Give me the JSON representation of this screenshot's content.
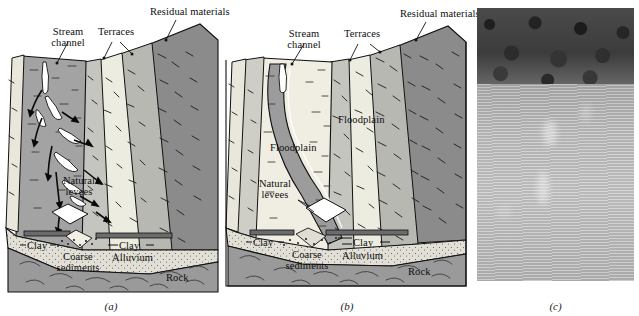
{
  "figure": {
    "panels": [
      {
        "id": "a",
        "caption": "(a)",
        "type": "block-diagram",
        "labels": [
          {
            "name": "stream-channel",
            "text": "Stream\nchannel"
          },
          {
            "name": "terraces",
            "text": "Terraces"
          },
          {
            "name": "residual-materials",
            "text": "Residual materials"
          },
          {
            "name": "natural-levees",
            "text": "Natural\nlevees"
          },
          {
            "name": "clay-left",
            "text": "Clay"
          },
          {
            "name": "clay-right",
            "text": "Clay"
          },
          {
            "name": "coarse-sediments",
            "text": "Coarse\nsediments"
          },
          {
            "name": "alluvium",
            "text": "Alluvium"
          },
          {
            "name": "rock",
            "text": "Rock"
          }
        ]
      },
      {
        "id": "b",
        "caption": "(b)",
        "type": "block-diagram",
        "labels": [
          {
            "name": "stream-channel",
            "text": "Stream\nchannel"
          },
          {
            "name": "terraces",
            "text": "Terraces"
          },
          {
            "name": "residual-materials",
            "text": "Residual materials"
          },
          {
            "name": "floodplain-upper",
            "text": "Floodplain"
          },
          {
            "name": "floodplain-lower",
            "text": "Floodplain"
          },
          {
            "name": "natural-levees",
            "text": "Natural\nlevees"
          },
          {
            "name": "clay-left",
            "text": "Clay"
          },
          {
            "name": "clay-right",
            "text": "Clay"
          },
          {
            "name": "coarse-sediments",
            "text": "Coarse\nsediments"
          },
          {
            "name": "alluvium",
            "text": "Alluvium"
          },
          {
            "name": "rock",
            "text": "Rock"
          }
        ]
      },
      {
        "id": "c",
        "caption": "(c)",
        "type": "photograph",
        "labels": []
      }
    ],
    "colors": {
      "valley_floor": "#a3a3a3",
      "terrace_light": "#ececdf",
      "terrace_mid": "#c9c9c4",
      "residual_dark": "#8b8b8b",
      "rock": "#9a9a9a",
      "alluvium": "#dedcd2",
      "clay_band": "#6f6f6f",
      "coarse_sediment": "#e8e6dc",
      "outline": "#111111",
      "photo_trees": "#3c3c3c",
      "photo_field": "#bdbdbd",
      "background": "#ffffff"
    }
  },
  "panel_a": {
    "caption": "(a)",
    "stream_channel": "Stream\nchannel",
    "terraces": "Terraces",
    "residual_materials": "Residual materials",
    "natural_levees": "Natural\nlevees",
    "clay_left": "Clay",
    "clay_right": "Clay",
    "coarse_sediments": "Coarse\nsediments",
    "alluvium": "Alluvium",
    "rock": "Rock"
  },
  "panel_b": {
    "caption": "(b)",
    "stream_channel": "Stream\nchannel",
    "terraces": "Terraces",
    "residual_materials": "Residual materials",
    "floodplain_upper": "Floodplain",
    "floodplain_lower": "Floodplain",
    "natural_levees": "Natural\nlevees",
    "clay_left": "Clay",
    "clay_right": "Clay",
    "coarse_sediments": "Coarse\nsediments",
    "alluvium": "Alluvium",
    "rock": "Rock"
  },
  "panel_c": {
    "caption": "(c)"
  }
}
